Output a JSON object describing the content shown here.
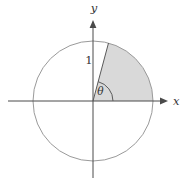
{
  "diagram": {
    "labels": {
      "x_axis": "x",
      "y_axis": "y",
      "radius": "1",
      "angle": "θ"
    },
    "angle_degrees": 75,
    "colors": {
      "background": "#ffffff",
      "sector_fill": "#d9d9d9",
      "circle_stroke": "#9a9a9a",
      "axis_stroke": "#4a4a4a",
      "radius_stroke": "#5a5a5a",
      "label": "#333333"
    }
  }
}
